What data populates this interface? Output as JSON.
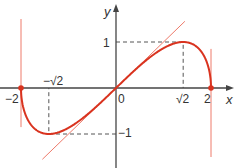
{
  "diagram": {
    "function": "y = x·sqrt(4 - x^2) / 2",
    "axes": {
      "x_label": "x",
      "y_label": "y",
      "x_range": [
        -2,
        2
      ],
      "y_range": [
        -1,
        1
      ]
    },
    "tick_labels": {
      "x_neg2": "−2",
      "x_negsqrt2": "−√2",
      "origin": "0",
      "x_sqrt2": "√2",
      "x_2": "2",
      "y_1": "1",
      "y_neg1": "−1"
    },
    "key_points": [
      {
        "x": -2,
        "y": 0
      },
      {
        "x": 2,
        "y": 0
      },
      {
        "x": 1.41421,
        "y": 1
      },
      {
        "x": -1.41421,
        "y": -1
      }
    ],
    "tangent_at_origin_slope": 1,
    "colors": {
      "curve": "#d9331f",
      "tangent": "#ee7a6a",
      "axis": "#444444",
      "dash": "#555555"
    }
  }
}
